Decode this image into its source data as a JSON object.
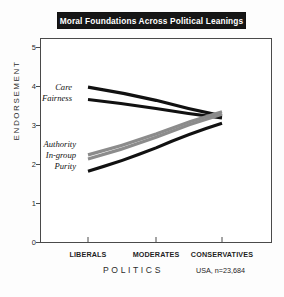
{
  "title": "Moral Foundations Across Political Leanings",
  "sample_note": "USA, n=23,684",
  "labels": {
    "care": "Care",
    "fairness": "Fairness",
    "authority": "Authority",
    "ingroup": "In-group",
    "purity": "Purity"
  },
  "axes": {
    "x_title": "POLITICS",
    "y_title": "ENDORSEMENT",
    "y_ticks": [
      "5",
      "4",
      "3",
      "2",
      "1",
      "0"
    ],
    "x_ticks": [
      "LIBERALS",
      "MODERATES",
      "CONSERVATIVES"
    ]
  },
  "colors": {
    "individualizing": "#111111",
    "binding": "#8c8c8c",
    "banner": "#161616",
    "frame": "#4a4a4a",
    "text": "#1f1f1f"
  },
  "chart_data": {
    "type": "line",
    "title": "Moral Foundations Across Political Leanings",
    "xlabel": "POLITICS",
    "ylabel": "ENDORSEMENT",
    "categories": [
      "LIBERALS",
      "MODERATES",
      "CONSERVATIVES"
    ],
    "ylim": [
      0,
      5
    ],
    "yticks": [
      0,
      1,
      2,
      3,
      4,
      5
    ],
    "grid": false,
    "legend": "inline-left-labels",
    "annotation": "USA, n=23,684",
    "series": [
      {
        "name": "Care",
        "values": [
          3.8,
          3.48,
          3.1
        ],
        "color": "#111111",
        "style": "solid"
      },
      {
        "name": "Fairness",
        "values": [
          3.5,
          3.28,
          3.05
        ],
        "color": "#111111",
        "style": "solid"
      },
      {
        "name": "Authority",
        "values": [
          2.15,
          2.66,
          3.2
        ],
        "color": "#8c8c8c",
        "style": "solid"
      },
      {
        "name": "In-group",
        "values": [
          2.05,
          2.58,
          3.14
        ],
        "color": "#8c8c8c",
        "style": "solid"
      },
      {
        "name": "Purity",
        "values": [
          1.75,
          2.32,
          2.92
        ],
        "color": "#111111",
        "style": "solid"
      }
    ]
  }
}
